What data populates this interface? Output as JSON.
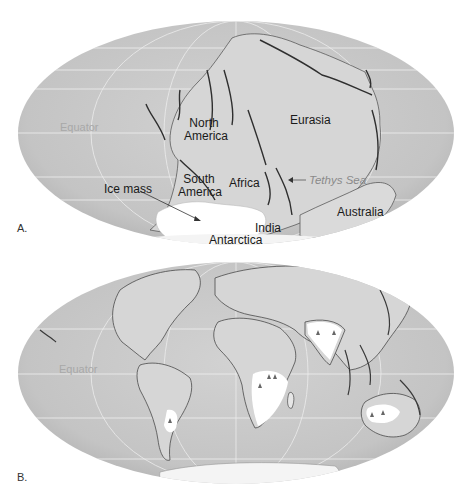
{
  "figure": {
    "panels": [
      {
        "id": "A",
        "letter": "A.",
        "description": "Pangaea supercontinent with glaciation",
        "labels": {
          "equator": "Equator",
          "north_america_1": "North",
          "north_america_2": "America",
          "eurasia": "Eurasia",
          "south_america_1": "South",
          "south_america_2": "America",
          "africa": "Africa",
          "tethys_sea": "Tethys Sea",
          "ice_mass": "Ice mass",
          "australia": "Australia",
          "india": "India",
          "antarctica": "Antarctica"
        }
      },
      {
        "id": "B",
        "letter": "B.",
        "description": "Present-day continents showing glaciated regions",
        "labels": {
          "equator": "Equator"
        }
      }
    ],
    "colors": {
      "ocean": "#c9c9c9",
      "land": "#dcdcdc",
      "ice": "#ffffff",
      "grid": "#eeeeee",
      "coastline": "#3a3a3a"
    }
  }
}
